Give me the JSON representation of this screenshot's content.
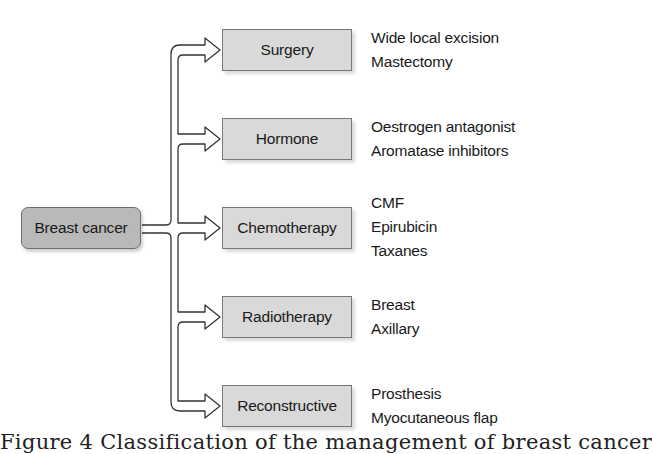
{
  "diagram": {
    "root": {
      "label": "Breast cancer"
    },
    "branches": [
      {
        "label": "Surgery",
        "items": [
          "Wide local excision",
          "Mastectomy"
        ]
      },
      {
        "label": "Hormone",
        "items": [
          "Oestrogen antagonist",
          "Aromatase inhibitors"
        ]
      },
      {
        "label": "Chemotherapy",
        "items": [
          "CMF",
          "Epirubicin",
          "Taxanes"
        ]
      },
      {
        "label": "Radiotherapy",
        "items": [
          "Breast",
          "Axillary"
        ]
      },
      {
        "label": "Reconstructive",
        "items": [
          "Prosthesis",
          "Myocutaneous flap"
        ]
      }
    ],
    "caption": "Figure 4 Classification of the management of breast cancer"
  },
  "colors": {
    "root_fill": "#b9b9b9",
    "node_fill": "#d9d9d9",
    "border": "#777777",
    "arrow_fill": "#ffffff",
    "arrow_stroke": "#333333"
  }
}
